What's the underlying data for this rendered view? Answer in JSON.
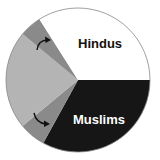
{
  "chart_data": {
    "type": "pie",
    "title": "",
    "direction": "clockwise",
    "start": "3 o'clock",
    "slices": [
      {
        "label": "Muslims",
        "value": 33,
        "color": "#161616",
        "label_color": "#ffffff",
        "show_label": true
      },
      {
        "label": "",
        "value": 6,
        "color": "#8a8a8a",
        "show_label": false
      },
      {
        "label": "",
        "value": 22,
        "color": "#b4b4b4",
        "show_label": false
      },
      {
        "label": "",
        "value": 5,
        "color": "#8a8a8a",
        "show_label": false
      },
      {
        "label": "Hindus",
        "value": 34,
        "color": "#ffffff",
        "label_color": "#111111",
        "show_label": true
      }
    ],
    "annotations": [
      {
        "type": "curved-arrow",
        "note": "arrow pointing from large gray slice into upper small gray slice"
      },
      {
        "type": "curved-arrow",
        "note": "arrow pointing from large gray slice into lower small gray slice"
      }
    ],
    "outline_color": "#888888"
  }
}
